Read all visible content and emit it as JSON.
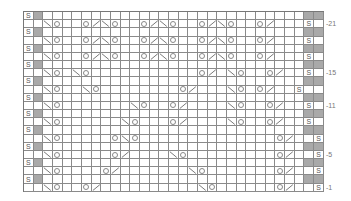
{
  "chart": {
    "columns": 31,
    "rows": 22,
    "legend_symbols": {
      "S": "slip",
      "O": "yarn-over",
      "/": "k2tog",
      "\\": "ssk",
      "G": "gray-cell",
      ".": "knit"
    },
    "row_labels": [
      {
        "row": 21,
        "label": "-21"
      },
      {
        "row": 15,
        "label": "-15"
      },
      {
        "row": 11,
        "label": "-11"
      },
      {
        "row": 5,
        "label": "-5"
      },
      {
        "row": 1,
        "label": "-1"
      }
    ],
    "grid": [
      "SG...........................GG",
      "..\\O..O/\\O..O/\\O..O/\\O..O/...S",
      "SG...........................GG",
      "..\\O..O/\\O..O/\\O..O/\\O..O/...S",
      "SG...........................GG",
      "..\\O..O/\\O..O/\\O..O/\\O..O/...S",
      "SG...........................GG",
      "..\\O.\\O...........O/.\\O..O/..S",
      "SG...........................GG",
      "..\\O..\\O........O/...\\O.O/..S.",
      "SG...........................GG",
      "..\\O.......\\O..O/....\\O..O/..S",
      "SG...........................GG",
      "..\\O......\\O...O/....\\O..O/..S",
      "SG...........................GG",
      "..\\O.....O\\O..............O/..S",
      "SG...........................GG",
      "..\\O.....O/....\\O.........O/..S",
      "SG...........................GG",
      "..\\O....O/.......\\O.......O/..S",
      "SG...........................GG",
      "..\\O..O/..........\\O......O/..S"
    ]
  }
}
